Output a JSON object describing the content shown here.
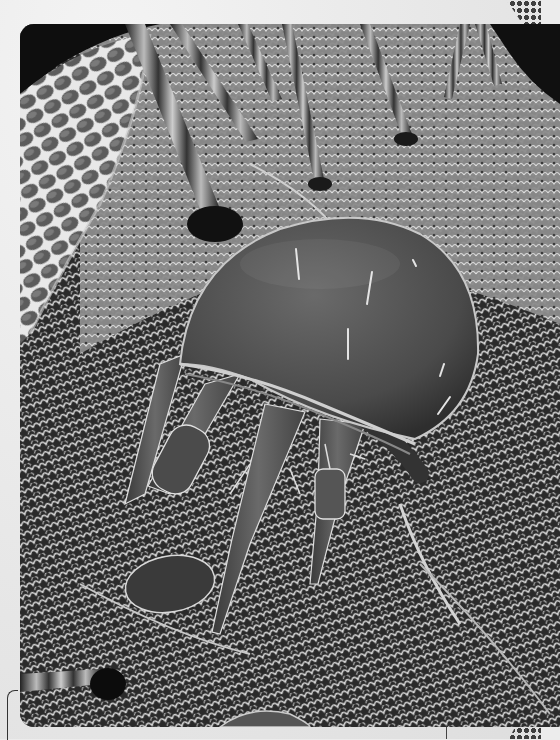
{
  "page": {
    "type": "scanned book page",
    "background_color": "#ececec"
  },
  "photo": {
    "subject": "scanning electron micrograph of a mite on an insect head",
    "color_mode": "grayscale",
    "elements": {
      "compound_eye": "top-left",
      "bristles": "top edge, angled downward",
      "mite_body": "center-right, dome-shaped",
      "mite_legs": "lower-left of body",
      "cuticle_texture": "scaly reticulated surface"
    },
    "colors": {
      "dark": "#1a1a1a",
      "mid": "#6e6e6e",
      "light": "#d8d8d8",
      "body": "#555555"
    }
  },
  "decorations": {
    "halftone_dots": [
      "top-right",
      "bottom-right"
    ],
    "margin_bracket": "bottom-left",
    "margin_tick": "bottom"
  }
}
